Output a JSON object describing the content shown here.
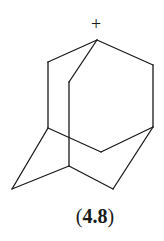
{
  "molecule": {
    "name": "1-adamantyl cation",
    "charge_symbol": "+",
    "label_open": "(",
    "label_number": "4.8",
    "label_close": ")",
    "stroke_color": "#1a1a1a",
    "vertices": {
      "apex": [
        97,
        40
      ],
      "upper_left": [
        48,
        62
      ],
      "upper_right": [
        153,
        65
      ],
      "inner_top": [
        69,
        82
      ],
      "left_mid": [
        48,
        128
      ],
      "right_mid": [
        153,
        127
      ],
      "bottom_center": [
        101,
        152
      ],
      "inner_bottom": [
        69,
        166
      ],
      "far_left": [
        12,
        189
      ],
      "bottom_right": [
        113,
        189
      ]
    },
    "bonds": [
      [
        "apex",
        "upper_left"
      ],
      [
        "apex",
        "upper_right"
      ],
      [
        "apex",
        "inner_top"
      ],
      [
        "upper_left",
        "left_mid"
      ],
      [
        "upper_right",
        "right_mid"
      ],
      [
        "inner_top",
        "inner_bottom"
      ],
      [
        "left_mid",
        "bottom_center"
      ],
      [
        "bottom_center",
        "right_mid"
      ],
      [
        "left_mid",
        "far_left"
      ],
      [
        "far_left",
        "inner_bottom"
      ],
      [
        "inner_bottom",
        "bottom_right"
      ],
      [
        "bottom_right",
        "right_mid"
      ]
    ]
  }
}
